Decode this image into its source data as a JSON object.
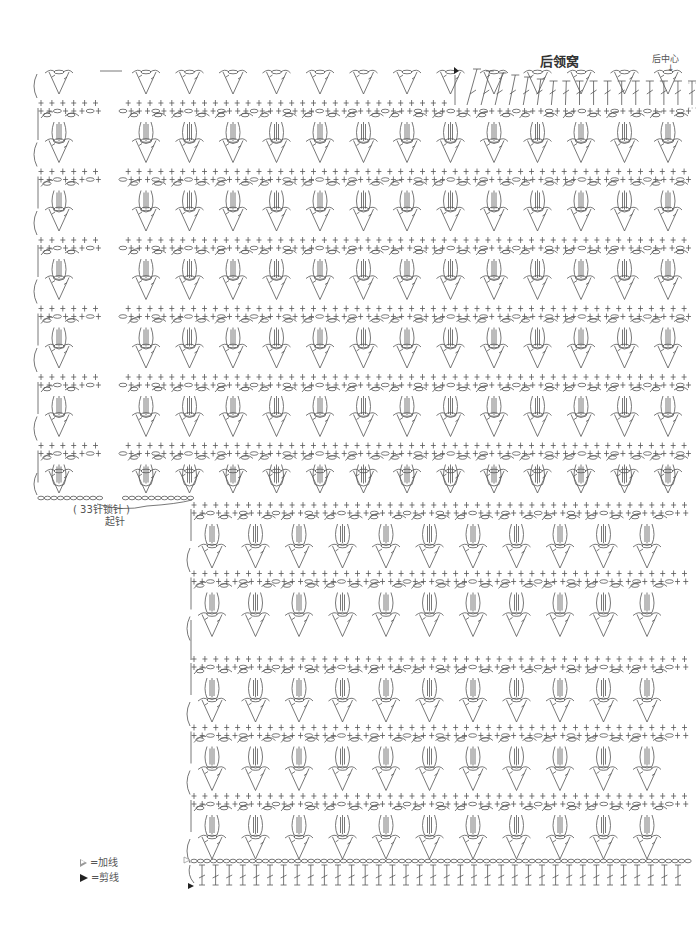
{
  "labels": {
    "neckline_title": "后领窝",
    "back_center": "后中心",
    "back_center_arrow": "↓",
    "foundation_chain_count": "( 33针锁针 )",
    "foundation_label": "起针"
  },
  "legend": [
    {
      "symbol": "join-yarn",
      "text": "=加线"
    },
    {
      "symbol": "cut-yarn",
      "text": "=剪线"
    }
  ],
  "colors": {
    "stroke": "#555555",
    "background": "#ffffff"
  },
  "chart_layout": {
    "top_block": {
      "x_start": 37,
      "x_end": 694,
      "left_gap": [
        100,
        122
      ],
      "row_top": 72,
      "repeat_height": 68.5,
      "repeats": 6,
      "last_v_row_y": 483,
      "foundation_y": 498
    },
    "bottom_block": {
      "x_start": 190,
      "x_end": 694,
      "first_row_y": 503,
      "segments": [
        {
          "start_y": 503,
          "repeats": 2
        },
        {
          "start_y": 657,
          "repeats": 3
        }
      ],
      "base_chain_y": 861,
      "base_stitches_y": 875
    },
    "neckline": {
      "x_start": 455,
      "x_end": 680,
      "y": 95,
      "stitch_count": 17
    },
    "motif_pitch": 43.5,
    "sc_pitch": 10.9
  }
}
